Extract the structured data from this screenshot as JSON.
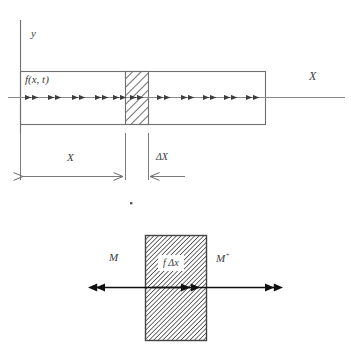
{
  "figure": {
    "title_present": false,
    "colors": {
      "stroke": "#6b6b6b",
      "stroke_dark": "#333333",
      "text": "#3c3c3c",
      "hatch": "#555555",
      "background": "#ffffff"
    },
    "top_diagram": {
      "name": "bar-with-distributed-load",
      "axis_y_label": "y",
      "axis_x_label": "X",
      "load_label": "f(x, t)",
      "element_hatched": true,
      "bar": {
        "x": 20,
        "y": 71,
        "width": 245,
        "height": 53
      },
      "hatched_slice": {
        "x": 125,
        "y": 71,
        "width": 23,
        "height": 53
      },
      "axis_line_y": 97,
      "axis_line_x_end": 345,
      "arrow_count": 12
    },
    "dimensions": {
      "x_label": "X",
      "delta_x_label": "ΔX",
      "x_from": 20,
      "x_to": 125,
      "delta_from": 125,
      "delta_to": 148,
      "dim_line_y": 176
    },
    "bottom_diagram": {
      "name": "free-body-element",
      "moment_left_label": "M",
      "moment_right_label_base": "M",
      "moment_right_label_sup": "+",
      "internal_force_label": "f Δx",
      "box": {
        "x": 145,
        "y": 235,
        "width": 61,
        "height": 105
      },
      "force_line_y": 287,
      "left_arrow_from": 206,
      "left_arrow_to": 88,
      "right_arrow_from": 206,
      "right_arrow_to": 283
    },
    "stray_dot": {
      "x": 131,
      "y": 203
    }
  }
}
